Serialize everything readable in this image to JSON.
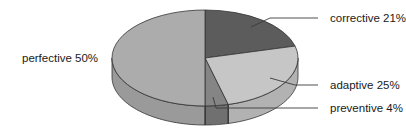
{
  "chart_data": {
    "type": "pie",
    "style": "3d",
    "title": "",
    "slices": [
      {
        "label": "corrective",
        "value": 21,
        "display": "corrective 21%",
        "color": "#5c5c5c",
        "side_color": "#4a4a4a"
      },
      {
        "label": "adaptive",
        "value": 25,
        "display": "adaptive 25%",
        "color": "#c6c6c6",
        "side_color": "#b2b2b2"
      },
      {
        "label": "preventive",
        "value": 4,
        "display": "preventive 4%",
        "color": "#858585",
        "side_color": "#707070"
      },
      {
        "label": "perfective",
        "value": 50,
        "display": "perfective 50%",
        "color": "#acacac",
        "side_color": "#9a9a9a"
      }
    ],
    "categories": [
      "corrective",
      "adaptive",
      "preventive",
      "perfective"
    ],
    "values": [
      21,
      25,
      4,
      50
    ],
    "unit": "%",
    "legend": "none (direct labels with leader lines)"
  },
  "labels": {
    "corrective": "corrective 21%",
    "adaptive": "adaptive 25%",
    "preventive": "preventive 4%",
    "perfective": "perfective 50%"
  }
}
